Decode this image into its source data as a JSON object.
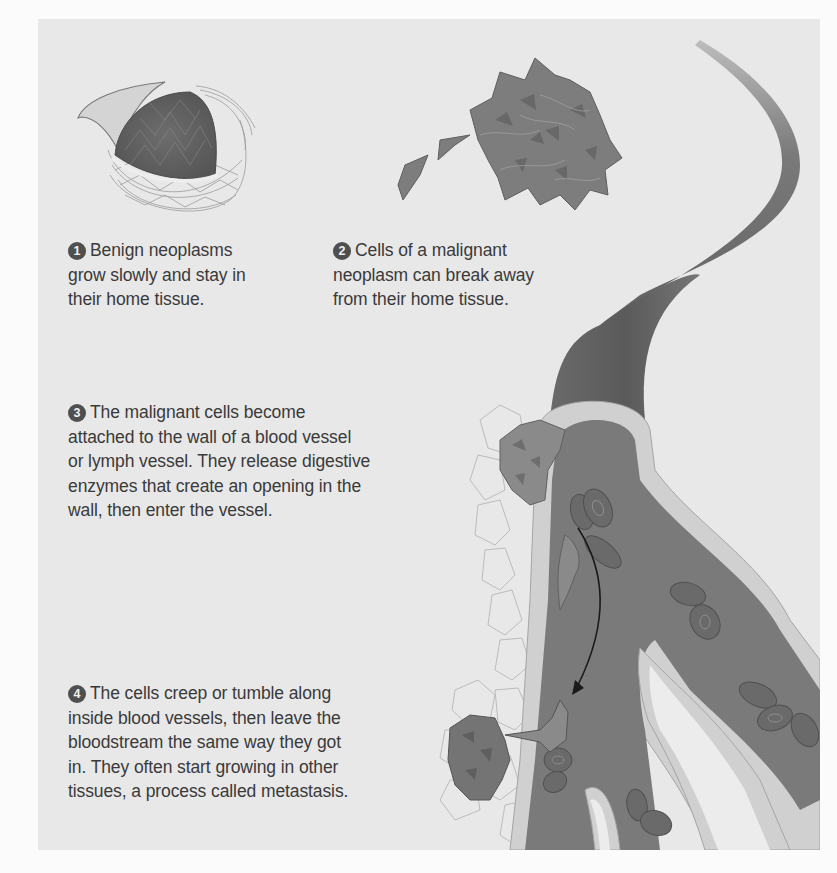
{
  "figure": {
    "colors": {
      "page_background": "#fbfbfb",
      "panel_background": "#e8e8e8",
      "badge": "#4f4f4f",
      "text": "#3a3a3a",
      "vessel_dark": "#5e5e5e",
      "vessel_wall": "#cfcfcf",
      "cells": "#7a7a7a"
    },
    "captions": [
      {
        "number": "1",
        "lines": [
          "Benign neoplasms",
          "grow slowly and stay in",
          "their home tissue."
        ]
      },
      {
        "number": "2",
        "lines": [
          "Cells of a malignant",
          "neoplasm can break away",
          "from their home tissue."
        ]
      },
      {
        "number": "3",
        "lines": [
          "The malignant cells become",
          "attached to the wall of a blood vessel",
          "or lymph vessel. They release digestive",
          "enzymes that create an opening in the",
          "wall, then enter the vessel."
        ]
      },
      {
        "number": "4",
        "lines": [
          "The cells creep or tumble along",
          "inside blood vessels, then leave the",
          "bloodstream the same way they got",
          "in. They often start growing in other",
          "tissues, a process called metastasis."
        ]
      }
    ],
    "illustrations": [
      "benign-neoplasm-encapsulated-tumor",
      "malignant-cell-cluster-with-detaching-cells",
      "blood-vessel-with-invading-cells",
      "red-blood-cells",
      "migration-arrow",
      "secondary-tumor-metastasis"
    ]
  }
}
